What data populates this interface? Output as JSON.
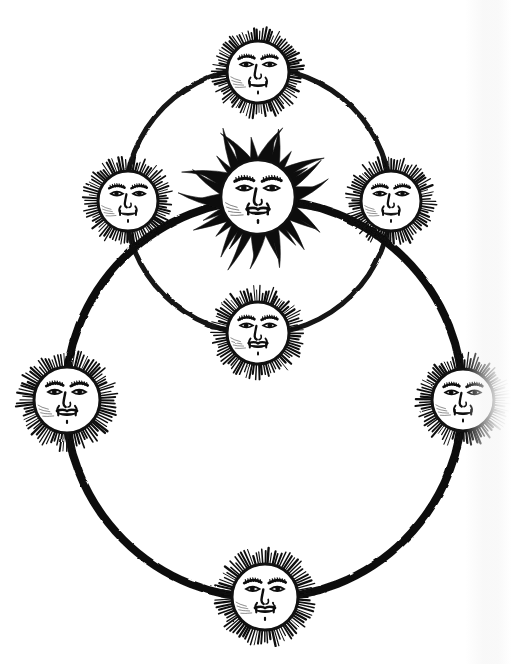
{
  "figure": {
    "title": "Woodcut diagram of two intersecting solar orbits",
    "style": "black ink woodcut engraving on white paper",
    "background_color": "#ffffff",
    "ink_color": "#111111",
    "canvas": {
      "width": 511,
      "height": 664
    }
  },
  "orbits": [
    {
      "id": "upper-orbit",
      "name": "upper-smaller-circle",
      "cx": 258,
      "cy": 201,
      "r": 133,
      "stroke_width": 5,
      "stroke_color": "#131313"
    },
    {
      "id": "lower-orbit",
      "name": "lower-larger-circle",
      "cx": 264,
      "cy": 399,
      "r": 199,
      "stroke_width": 8,
      "stroke_color": "#111111"
    }
  ],
  "suns": [
    {
      "id": "sun-center",
      "name": "central-radiant-sun",
      "label": "Central Sun",
      "cx": 258,
      "cy": 197,
      "face_radius": 37,
      "ray_type": "long-flame",
      "ray_count": 34,
      "ray_length": 34,
      "on_orbit": "none",
      "expression": "solemn"
    },
    {
      "id": "sun-top",
      "name": "sun-top",
      "label": "Top Sun",
      "cx": 258,
      "cy": 72,
      "face_radius": 31,
      "ray_type": "short-bristle",
      "ray_count": 86,
      "ray_length": 13,
      "on_orbit": "upper-orbit",
      "expression": "smiling"
    },
    {
      "id": "sun-upper-left",
      "name": "sun-upper-left",
      "label": "Upper Left Sun",
      "cx": 128,
      "cy": 201,
      "face_radius": 30,
      "ray_type": "short-bristle",
      "ray_count": 84,
      "ray_length": 13,
      "on_orbit": "upper-orbit-and-lower-orbit",
      "expression": "smiling"
    },
    {
      "id": "sun-upper-right",
      "name": "sun-upper-right",
      "label": "Upper Right Sun",
      "cx": 391,
      "cy": 201,
      "face_radius": 30,
      "ray_type": "short-bristle",
      "ray_count": 84,
      "ray_length": 13,
      "on_orbit": "upper-orbit-and-lower-orbit",
      "expression": "smiling"
    },
    {
      "id": "sun-middle",
      "name": "sun-middle-lower",
      "label": "Middle Sun",
      "cx": 258,
      "cy": 333,
      "face_radius": 31,
      "ray_type": "short-bristle",
      "ray_count": 86,
      "ray_length": 14,
      "on_orbit": "upper-orbit",
      "expression": "moustached"
    },
    {
      "id": "sun-left",
      "name": "sun-left",
      "label": "Left Sun",
      "cx": 67,
      "cy": 400,
      "face_radius": 33,
      "ray_type": "short-bristle",
      "ray_count": 88,
      "ray_length": 15,
      "on_orbit": "lower-orbit",
      "expression": "stern"
    },
    {
      "id": "sun-right",
      "name": "sun-right",
      "label": "Right Sun",
      "cx": 463,
      "cy": 400,
      "face_radius": 31,
      "ray_type": "short-bristle",
      "ray_count": 86,
      "ray_length": 14,
      "on_orbit": "lower-orbit",
      "expression": "smiling"
    },
    {
      "id": "sun-bottom",
      "name": "sun-bottom",
      "label": "Bottom Sun",
      "cx": 265,
      "cy": 597,
      "face_radius": 33,
      "ray_type": "short-bristle",
      "ray_count": 88,
      "ray_length": 15,
      "on_orbit": "lower-orbit",
      "expression": "solemn"
    }
  ],
  "counts": {
    "total_suns": 7,
    "orbital_suns": 6,
    "central_suns": 1,
    "circles": 2
  }
}
